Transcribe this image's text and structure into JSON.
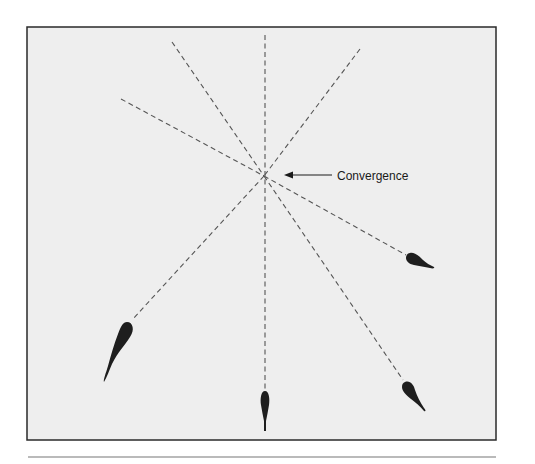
{
  "figure": {
    "annotation_label": "Convergence",
    "colors": {
      "panel_fill": "#eeeeee",
      "panel_border": "#2a2a2a",
      "line": "#555555",
      "creature": "#1e1e1e",
      "rule": "#777777"
    },
    "convergence_point": {
      "x": 264,
      "y": 176
    },
    "dashed_lines": [
      {
        "id": "upper-left-shallow",
        "x1": 121,
        "y1": 99,
        "x2": 264,
        "y2": 176
      },
      {
        "id": "upper-left-steep",
        "x1": 172,
        "y1": 42,
        "x2": 264,
        "y2": 176
      },
      {
        "id": "vertical",
        "x1": 265,
        "y1": 35,
        "x2": 265,
        "y2": 176
      },
      {
        "id": "upper-right",
        "x1": 360,
        "y1": 49,
        "x2": 264,
        "y2": 176
      }
    ],
    "tadpoles": [
      {
        "id": "lower-left",
        "head_x": 127,
        "head_y": 327,
        "tail_x": 104,
        "tail_y": 382
      },
      {
        "id": "bottom-center",
        "head_x": 265,
        "head_y": 402,
        "tail_x": 265,
        "tail_y": 431
      },
      {
        "id": "lower-right",
        "head_x": 407,
        "head_y": 388,
        "tail_x": 425,
        "tail_y": 410
      },
      {
        "id": "right",
        "head_x": 413,
        "head_y": 258,
        "tail_x": 432,
        "tail_y": 267
      }
    ]
  }
}
